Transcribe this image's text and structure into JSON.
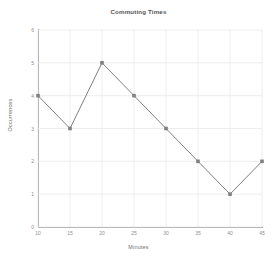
{
  "chart_data": {
    "type": "line",
    "title": "Commuting Times",
    "xlabel": "Minutes",
    "ylabel": "Occurrences",
    "x": [
      10,
      15,
      20,
      25,
      30,
      35,
      40,
      45
    ],
    "values": [
      4,
      3,
      5,
      4,
      3,
      2,
      1,
      2
    ],
    "series": [
      {
        "name": "Occurrences",
        "values": [
          4,
          3,
          5,
          4,
          3,
          2,
          1,
          2
        ]
      }
    ],
    "xlim": [
      10,
      45
    ],
    "ylim": [
      0,
      6
    ],
    "xticks": [
      "10",
      "15",
      "20",
      "25",
      "30",
      "35",
      "40",
      "45"
    ],
    "yticks": [
      "0",
      "1",
      "2",
      "3",
      "4",
      "5",
      "6"
    ],
    "grid": true,
    "legend": false,
    "legend_position": "none",
    "marker": "square",
    "line_color": "#808080",
    "marker_color": "#808080",
    "grid_color": "#e8e8e8",
    "axis_color": "#9a9a9a",
    "title_color": "#555555",
    "tick_color": "#8f8f8f"
  }
}
